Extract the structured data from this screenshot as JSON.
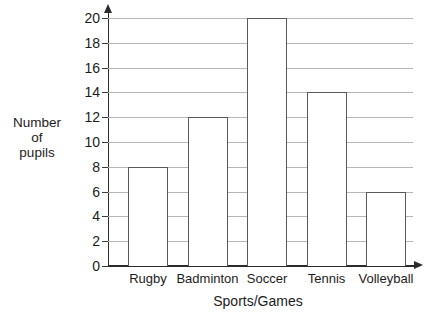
{
  "chart_data": {
    "type": "bar",
    "title": "",
    "categories": [
      "Rugby",
      "Badminton",
      "Soccer",
      "Tennis",
      "Volleyball"
    ],
    "values": [
      8,
      12,
      20,
      14,
      6
    ],
    "xlabel": "Sports/Games",
    "ylabel": "Number of pupils",
    "ylabel_lines": [
      "Number",
      "of",
      "pupils"
    ],
    "ylim": [
      0,
      20
    ],
    "ytick_labels": [
      "0",
      "2",
      "4",
      "6",
      "8",
      "10",
      "12",
      "14",
      "16",
      "18",
      "20"
    ],
    "ytick_values": [
      0,
      2,
      4,
      6,
      8,
      10,
      12,
      14,
      16,
      18,
      20
    ],
    "grid": true,
    "grid_orientation": "horizontal",
    "legend": null,
    "colors": {
      "background": "#ffffff",
      "bar_fill": "#ffffff",
      "bar_outline": "#5a5a5a",
      "gridline": "#b6b6b6",
      "axis": "#2b2b2b",
      "text": "#1c1c1c"
    }
  }
}
